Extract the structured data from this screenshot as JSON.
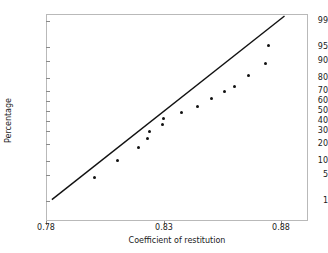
{
  "chart_data": {
    "type": "scatter",
    "title": "",
    "subtitle": "",
    "xlabel": "Coefficient of restitution",
    "ylabel": "Percentage",
    "plot_kind": "normal-probability-plot",
    "grid": false,
    "legend": false,
    "xlim": [
      0.78,
      0.885
    ],
    "ylim": [
      1,
      99
    ],
    "x_ticks": [
      0.78,
      0.83,
      0.88
    ],
    "x_tick_labels": [
      "0.78",
      "0.83",
      "0.88"
    ],
    "y_ticks": [
      1,
      5,
      10,
      20,
      30,
      40,
      50,
      60,
      70,
      80,
      90,
      95,
      99
    ],
    "y_tick_labels": [
      "1",
      "5",
      "10",
      "20",
      "30",
      "40",
      "50",
      "60",
      "70",
      "80",
      "90",
      "95",
      "99"
    ],
    "y_scale": "normal-probability",
    "point_color": "#111111",
    "line_color": "#111111",
    "frame_color": "#b9b9b9",
    "points": [
      {
        "x": 0.8005,
        "y": 4.2
      },
      {
        "x": 0.8105,
        "y": 10.2
      },
      {
        "x": 0.8195,
        "y": 17.0
      },
      {
        "x": 0.823,
        "y": 24.0
      },
      {
        "x": 0.824,
        "y": 30.0
      },
      {
        "x": 0.8295,
        "y": 36.0
      },
      {
        "x": 0.83,
        "y": 42.5
      },
      {
        "x": 0.8375,
        "y": 48.5
      },
      {
        "x": 0.8445,
        "y": 54.5
      },
      {
        "x": 0.8505,
        "y": 62.5
      },
      {
        "x": 0.856,
        "y": 69.0
      },
      {
        "x": 0.86,
        "y": 74.0
      },
      {
        "x": 0.866,
        "y": 82.0
      },
      {
        "x": 0.8735,
        "y": 89.0
      },
      {
        "x": 0.8745,
        "y": 95.5
      }
    ],
    "fit_line": {
      "x_start": 0.7825,
      "y_start": 1.1,
      "x_end": 0.8815,
      "y_end": 99.3
    },
    "n_points": 15
  },
  "axes": {
    "y_title": "Percentage",
    "x_title": "Coefficient of restitution",
    "y_labels": [
      "99",
      "95",
      "90",
      "80",
      "70",
      "60",
      "50",
      "40",
      "30",
      "20",
      "10",
      "5",
      "1"
    ],
    "x_labels": [
      "0.78",
      "0.83",
      "0.88"
    ]
  }
}
